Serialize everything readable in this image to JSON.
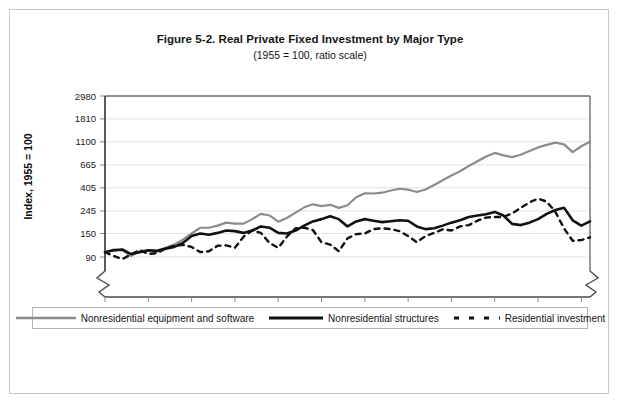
{
  "chart_data": {
    "type": "line",
    "title": "Figure 5-2. Real Private Fixed Investment by Major Type",
    "subtitle": "(1955 = 100, ratio scale)",
    "xlabel": "Year",
    "ylabel": "Index, 1955 = 100",
    "scale": "log",
    "grid": true,
    "legend_position": "bottom",
    "xlim": [
      1955,
      2011
    ],
    "ylim": [
      90,
      2980
    ],
    "xticks": [
      1955,
      1960,
      1965,
      1970,
      1975,
      1980,
      1985,
      1990,
      1995,
      2000,
      2005,
      2010
    ],
    "yticks": [
      90,
      150,
      245,
      405,
      665,
      1100,
      1810,
      2980
    ],
    "x": [
      1955,
      1956,
      1957,
      1958,
      1959,
      1960,
      1961,
      1962,
      1963,
      1964,
      1965,
      1966,
      1967,
      1968,
      1969,
      1970,
      1971,
      1972,
      1973,
      1974,
      1975,
      1976,
      1977,
      1978,
      1979,
      1980,
      1981,
      1982,
      1983,
      1984,
      1985,
      1986,
      1987,
      1988,
      1989,
      1990,
      1991,
      1992,
      1993,
      1994,
      1995,
      1996,
      1997,
      1998,
      1999,
      2000,
      2001,
      2002,
      2003,
      2004,
      2005,
      2006,
      2007,
      2008,
      2009,
      2010,
      2011
    ],
    "series": [
      {
        "name": "Nonresidential equipment and software",
        "style": "solid",
        "color": "#8c8c8c",
        "width": 2.2,
        "values": [
          100,
          106,
          104,
          92,
          102,
          104,
          101,
          110,
          118,
          131,
          150,
          170,
          170,
          178,
          190,
          186,
          186,
          205,
          230,
          222,
          194,
          210,
          236,
          265,
          283,
          272,
          280,
          262,
          277,
          330,
          360,
          358,
          364,
          382,
          397,
          390,
          370,
          390,
          430,
          478,
          530,
          580,
          650,
          720,
          800,
          865,
          820,
          790,
          830,
          900,
          975,
          1030,
          1080,
          1040,
          880,
          1000,
          1100
        ]
      },
      {
        "name": "Nonresidential structures",
        "style": "solid",
        "color": "#111111",
        "width": 2.6,
        "values": [
          100,
          104,
          106,
          96,
          100,
          104,
          103,
          108,
          112,
          122,
          142,
          150,
          146,
          152,
          160,
          158,
          152,
          160,
          175,
          170,
          152,
          150,
          160,
          178,
          195,
          205,
          218,
          205,
          175,
          195,
          205,
          198,
          192,
          196,
          200,
          198,
          175,
          165,
          168,
          178,
          190,
          200,
          215,
          222,
          228,
          240,
          222,
          185,
          180,
          190,
          205,
          230,
          250,
          262,
          200,
          178,
          195
        ]
      },
      {
        "name": "Residential investment",
        "style": "dashed",
        "color": "#111111",
        "width": 2.4,
        "values": [
          100,
          92,
          86,
          95,
          105,
          96,
          98,
          108,
          115,
          117,
          112,
          100,
          102,
          115,
          116,
          110,
          140,
          160,
          152,
          122,
          110,
          140,
          168,
          170,
          162,
          124,
          118,
          102,
          135,
          148,
          150,
          165,
          168,
          165,
          158,
          142,
          124,
          142,
          152,
          164,
          160,
          175,
          180,
          198,
          212,
          215,
          215,
          232,
          262,
          295,
          320,
          300,
          240,
          168,
          128,
          130,
          138
        ]
      }
    ]
  },
  "legend": {
    "items": [
      {
        "label": "Nonresidential equipment and software",
        "style": "solid",
        "color": "#8c8c8c"
      },
      {
        "label": "Nonresidential structures",
        "style": "solid",
        "color": "#111111"
      },
      {
        "label": "Residential investment",
        "style": "dashed",
        "color": "#111111"
      }
    ]
  }
}
